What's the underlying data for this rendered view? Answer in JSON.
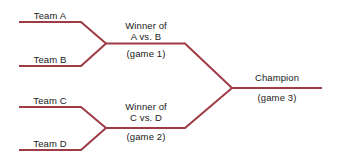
{
  "diagram": {
    "type": "single-elimination-tournament-bracket",
    "title": "",
    "line_color": "#9e3b44",
    "text_color": "#1a1a1a",
    "background_color": "#ffffff",
    "round1": {
      "label": "",
      "teams": [
        {
          "id": "team-a",
          "label": "Team A"
        },
        {
          "id": "team-b",
          "label": "Team B"
        },
        {
          "id": "team-c",
          "label": "Team C"
        },
        {
          "id": "team-d",
          "label": "Team D"
        }
      ]
    },
    "round2": {
      "matches": [
        {
          "id": "game-1",
          "line1": "Winner of",
          "line2": "A vs. B",
          "game": "(game 1)"
        },
        {
          "id": "game-2",
          "line1": "Winner of",
          "line2": "C vs. D",
          "game": "(game 2)"
        }
      ]
    },
    "round3": {
      "matches": [
        {
          "id": "game-3",
          "line1": "Champion",
          "game": "(game 3)"
        }
      ]
    }
  }
}
